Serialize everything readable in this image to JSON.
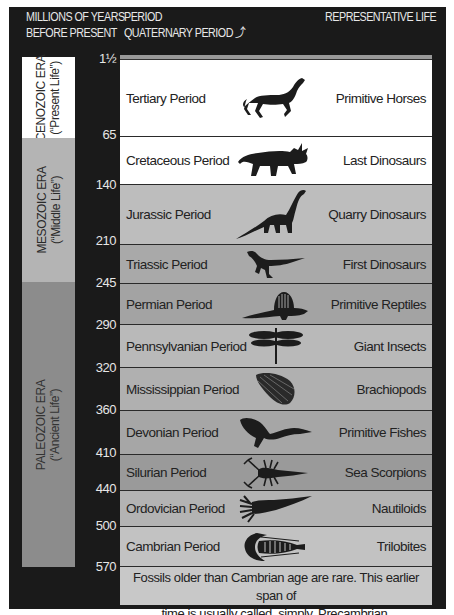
{
  "header": {
    "col1_line1": "MILLIONS OF YEARS",
    "col1_line2": "BEFORE PRESENT",
    "col2_line1": "PERIOD",
    "col2_line2": "QUATERNARY PERIOD ⤴",
    "col3_line1": "REPRESENTATIVE LIFE"
  },
  "eras": [
    {
      "name": "CENOZOIC ERA",
      "subtitle": "(“Present Life”)",
      "color": "#ffffff"
    },
    {
      "name": "MESOZOIC ERA",
      "subtitle": "(“Middle Life”)",
      "color": "#b4b4b4"
    },
    {
      "name": "PALEOZOIC ERA",
      "subtitle": "(“Ancient Life”)",
      "color": "#8c8c8c"
    }
  ],
  "ticks": [
    "1½",
    "65",
    "140",
    "210",
    "245",
    "290",
    "320",
    "360",
    "410",
    "440",
    "500",
    "570"
  ],
  "periods": [
    {
      "name": "Tertiary Period",
      "life": "Primitive Horses",
      "icon": "horse-icon",
      "color": "#ffffff"
    },
    {
      "name": "Cretaceous Period",
      "life": "Last Dinosaurs",
      "icon": "triceratops-icon",
      "color": "#ffffff"
    },
    {
      "name": "Jurassic Period",
      "life": "Quarry Dinosaurs",
      "icon": "sauropod-icon",
      "color": "#bdbdbd"
    },
    {
      "name": "Triassic Period",
      "life": "First Dinosaurs",
      "icon": "theropod-icon",
      "color": "#a9a9a9"
    },
    {
      "name": "Permian Period",
      "life": "Primitive Reptiles",
      "icon": "dimetrodon-icon",
      "color": "#a3a3a3"
    },
    {
      "name": "Pennsylvanian Period",
      "life": "Giant Insects",
      "icon": "dragonfly-icon",
      "color": "#b9b9b9"
    },
    {
      "name": "Mississippian Period",
      "life": "Brachiopods",
      "icon": "brachiopod-shell-icon",
      "color": "#b0b0b0"
    },
    {
      "name": "Devonian Period",
      "life": "Primitive Fishes",
      "icon": "primitive-fish-icon",
      "color": "#a6a6a6"
    },
    {
      "name": "Silurian Period",
      "life": "Sea Scorpions",
      "icon": "sea-scorpion-icon",
      "color": "#9a9a9a"
    },
    {
      "name": "Ordovician Period",
      "life": "Nautiloids",
      "icon": "nautiloid-icon",
      "color": "#b3b3b3"
    },
    {
      "name": "Cambrian Period",
      "life": "Trilobites",
      "icon": "trilobite-icon",
      "color": "#c2c2c2"
    }
  ],
  "quaternary_strip_color": "#999999",
  "footer": {
    "line1": "Fossils older than Cambrian age are rare. This earlier span of",
    "line2": "time is usually called, simply, Precambrian.",
    "color": "#c8c8c8"
  }
}
